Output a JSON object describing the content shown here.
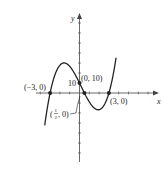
{
  "chart_data": {
    "type": "line",
    "title": "",
    "xlabel": "x",
    "ylabel": "y",
    "function": "f(x) = (10/9)(x+3)(x-3)(2x-1)",
    "xlim": [
      -7,
      7.5
    ],
    "ylim": [
      -75,
      80
    ],
    "grid": false,
    "x_tick_step": 1,
    "y_tick_step": 10,
    "points": [
      {
        "label": "(−3, 0)",
        "x": -3,
        "y": 0
      },
      {
        "label": "(0, 10)",
        "x": 0,
        "y": 10
      },
      {
        "label": "(1/2, 0)",
        "x": 0.5,
        "y": 0
      },
      {
        "label": "(3, 0)",
        "x": 3,
        "y": 0
      }
    ],
    "annotations": {
      "y_intercept_tick": "10",
      "half_label_num": "1",
      "half_label_den": "2",
      "half_label_rest": ", 0)",
      "half_label_open": "("
    }
  },
  "colors": {
    "curve": "#222222",
    "axes": "#444444"
  }
}
